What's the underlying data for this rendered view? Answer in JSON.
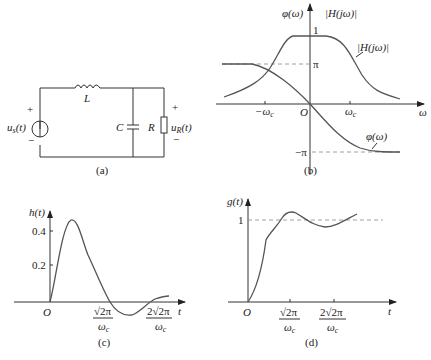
{
  "figure_a": {
    "caption": "(a)",
    "source_label": "u",
    "source_sub": "s",
    "source_arg": "(t)",
    "output_label": "u",
    "output_sub": "R",
    "output_arg": "(t)",
    "inductor_label": "L",
    "capacitor_label": "C",
    "resistor_label": "R",
    "plus": "+",
    "minus": "−"
  },
  "figure_b": {
    "caption": "(b)",
    "y_label_phase": "φ(ω)",
    "y_label_mag": "|H(jω)|",
    "curve_label_mag": "|H(jω)|",
    "curve_label_phase": "φ(ω)",
    "tick_one": "1",
    "tick_pi": "π",
    "tick_neg_pi": "−π",
    "x_label": "ω",
    "origin": "O",
    "tick_neg_wc": "−ω",
    "tick_wc": "ω",
    "sub_c": "c"
  },
  "figure_c": {
    "caption": "(c)",
    "y_label": "h(t)",
    "x_label": "t",
    "origin": "O",
    "ticks_y": [
      "0.4",
      "0.2"
    ],
    "tick1_num": "√2π",
    "tick2_num": "2√2π",
    "tick_den": "ω",
    "sub_c": "c"
  },
  "figure_d": {
    "caption": "(d)",
    "y_label": "g(t)",
    "x_label": "t",
    "origin": "O",
    "tick_one": "1",
    "tick1_num": "√2π",
    "tick2_num": "2√2π",
    "tick_den": "ω",
    "sub_c": "c"
  }
}
